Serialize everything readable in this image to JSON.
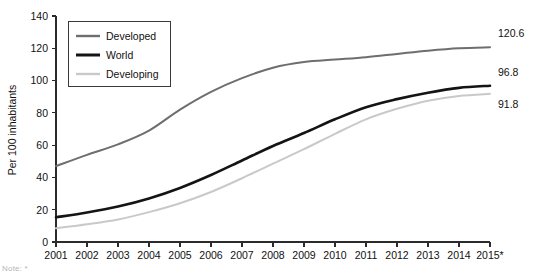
{
  "chart_data": {
    "type": "line",
    "title": "",
    "xlabel": "",
    "ylabel": "Per 100 inhabitants",
    "ylim": [
      0,
      140
    ],
    "ytick_step": 20,
    "yticks": [
      0,
      20,
      40,
      60,
      80,
      100,
      120,
      140
    ],
    "grid": false,
    "legend_position": "top-left",
    "categories": [
      "2001",
      "2002",
      "2003",
      "2004",
      "2005",
      "2006",
      "2007",
      "2008",
      "2009",
      "2010",
      "2011",
      "2012",
      "2013",
      "2014",
      "2015*"
    ],
    "series": [
      {
        "name": "Developed",
        "color": "#6e6e6e",
        "width": 2.0,
        "end_label": "120.6",
        "values": [
          47.0,
          54.0,
          60.5,
          69.0,
          82.0,
          93.0,
          101.5,
          108.0,
          111.5,
          113.0,
          114.5,
          116.5,
          118.5,
          120.0,
          120.6
        ]
      },
      {
        "name": "World",
        "color": "#141414",
        "width": 2.6,
        "end_label": "96.8",
        "values": [
          15.3,
          18.3,
          22.0,
          27.0,
          33.5,
          41.5,
          50.5,
          59.5,
          67.5,
          76.0,
          83.5,
          88.5,
          92.5,
          95.5,
          96.8
        ]
      },
      {
        "name": "Developing",
        "color": "#c9c9c9",
        "width": 2.0,
        "end_label": "91.8",
        "values": [
          8.5,
          11.0,
          14.0,
          18.5,
          24.0,
          31.0,
          39.5,
          48.5,
          57.5,
          67.0,
          76.0,
          82.5,
          87.5,
          90.5,
          91.8
        ]
      }
    ],
    "end_labels": [
      "120.6",
      "96.8",
      "91.8"
    ]
  },
  "legend": {
    "items": [
      {
        "label": "Developed"
      },
      {
        "label": "World"
      },
      {
        "label": "Developing"
      }
    ]
  },
  "axes": {
    "y_title": "Per 100 inhabitants",
    "y_labels": [
      "140",
      "120",
      "100",
      "80",
      "60",
      "40",
      "20",
      "0"
    ],
    "x_labels": [
      "2001",
      "2002",
      "2003",
      "2004",
      "2005",
      "2006",
      "2007",
      "2008",
      "2009",
      "2010",
      "2011",
      "2012",
      "2013",
      "2014",
      "2015*"
    ]
  },
  "end_values": {
    "developed": "120.6",
    "world": "96.8",
    "developing": "91.8"
  },
  "footnote": {
    "text": "Note: *"
  }
}
